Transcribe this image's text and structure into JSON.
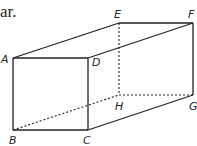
{
  "text_fragment": "ar.",
  "diagram": {
    "type": "rectangular prism",
    "vertices": {
      "A": [
        13,
        58
      ],
      "B": [
        13,
        130
      ],
      "C": [
        88,
        130
      ],
      "D": [
        88,
        58
      ],
      "E": [
        119,
        23
      ],
      "F": [
        193,
        23
      ],
      "G": [
        193,
        95
      ],
      "H": [
        119,
        95
      ]
    },
    "labels": {
      "A": {
        "text": "A",
        "x": 1,
        "y": 63
      },
      "B": {
        "text": "B",
        "x": 9,
        "y": 144
      },
      "C": {
        "text": "C",
        "x": 83,
        "y": 144
      },
      "D": {
        "text": "D",
        "x": 92,
        "y": 66
      },
      "E": {
        "text": "E",
        "x": 114,
        "y": 18
      },
      "F": {
        "text": "F",
        "x": 188,
        "y": 18
      },
      "G": {
        "text": "G",
        "x": 189,
        "y": 110
      },
      "H": {
        "text": "H",
        "x": 115,
        "y": 110
      }
    },
    "solid_edges": [
      [
        "A",
        "B"
      ],
      [
        "B",
        "C"
      ],
      [
        "C",
        "D"
      ],
      [
        "D",
        "A"
      ],
      [
        "A",
        "E"
      ],
      [
        "E",
        "F"
      ],
      [
        "D",
        "F"
      ],
      [
        "F",
        "G"
      ],
      [
        "C",
        "G"
      ]
    ],
    "dashed_edges": [
      [
        "E",
        "H"
      ],
      [
        "H",
        "G"
      ],
      [
        "B",
        "H"
      ]
    ],
    "stroke_color": "#231f20"
  }
}
